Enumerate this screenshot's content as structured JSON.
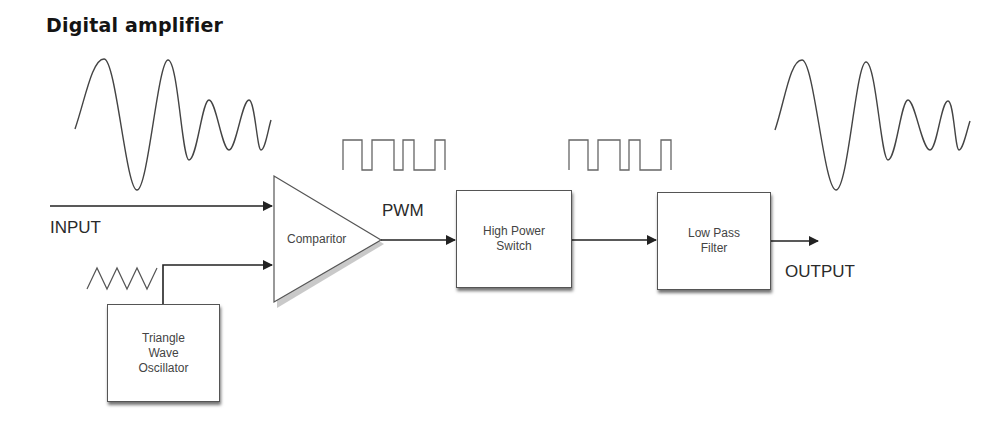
{
  "title": "Digital amplifier",
  "labels": {
    "input": "INPUT",
    "pwm": "PWM",
    "output": "OUTPUT"
  },
  "blocks": {
    "comparator": "Comparitor",
    "oscillator": "Triangle\nWave\nOscillator",
    "switch": "High Power\nSwitch",
    "filter": "Low Pass\nFilter"
  },
  "signals": {
    "input_waveform": "analog-sine-icon",
    "pwm_waveform_1": "pwm-square-wave-icon",
    "pwm_waveform_2": "pwm-square-wave-icon",
    "triangle_waveform": "triangle-wave-icon",
    "output_waveform": "analog-sine-icon"
  },
  "colors": {
    "line": "#222222",
    "box_border": "#555555",
    "text": "#2a2a2a"
  }
}
